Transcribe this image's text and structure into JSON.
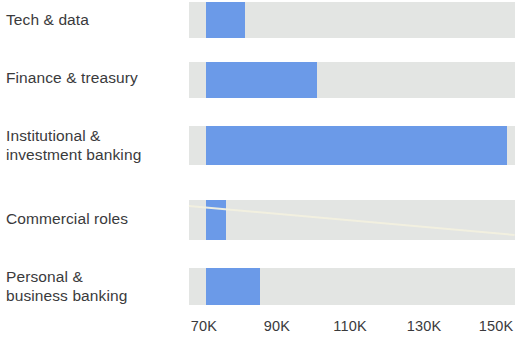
{
  "chart_data": {
    "type": "bar",
    "orientation": "horizontal",
    "title": "",
    "xlabel": "",
    "ylabel": "",
    "categories": [
      "Tech & data",
      "Finance & treasury",
      "Institutional &\ninvestment banking",
      "Commercial roles",
      "Personal &\nbusiness banking"
    ],
    "values": [
      80,
      101,
      153,
      76,
      85
    ],
    "value_unit": "K",
    "baseline": 66,
    "xticks": [
      70,
      90,
      110,
      130,
      150
    ],
    "xtick_labels": [
      "70K",
      "90K",
      "110K",
      "130K",
      "150K"
    ],
    "xlim": [
      66,
      160
    ],
    "grid": false,
    "legend": null,
    "colors": {
      "bar": "#6b9ae8",
      "track": "#e3e5e3",
      "text": "#3a3a3c",
      "background": "#ffffff",
      "artifact": "#f2f0df"
    }
  },
  "rows": [
    {
      "label": "Tech & data",
      "label_top": 10,
      "bar_top": 2,
      "bar_height": 36,
      "fill_left": 206,
      "fill_right": 245
    },
    {
      "label": "Finance & treasury",
      "label_top": 68,
      "bar_top": 62,
      "bar_height": 36,
      "fill_left": 206,
      "fill_right": 317
    },
    {
      "label": "Institutional &\ninvestment banking",
      "label_top": 126,
      "bar_top": 126,
      "bar_height": 39,
      "fill_left": 206,
      "fill_right": 507
    },
    {
      "label": "Commercial roles",
      "label_top": 209,
      "bar_top": 200,
      "bar_height": 40,
      "fill_left": 206,
      "fill_right": 226
    },
    {
      "label": "Personal &\nbusiness banking",
      "label_top": 267,
      "bar_top": 268,
      "bar_height": 37,
      "fill_left": 206,
      "fill_right": 260
    }
  ],
  "track": {
    "left": 189,
    "width": 326
  },
  "axis": {
    "ticks": [
      {
        "label": "70K",
        "x": 204
      },
      {
        "label": "90K",
        "x": 277
      },
      {
        "label": "110K",
        "x": 350
      },
      {
        "label": "130K",
        "x": 424
      },
      {
        "label": "150K",
        "x": 496
      }
    ]
  }
}
